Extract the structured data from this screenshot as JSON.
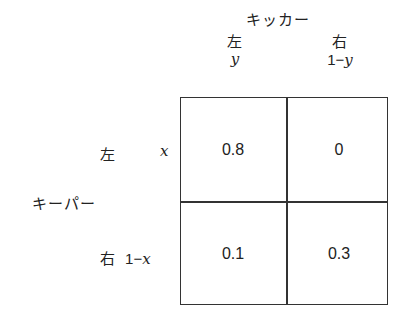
{
  "column_player": {
    "label": "キッカー",
    "strategies": [
      {
        "name": "左",
        "prob": "y"
      },
      {
        "name": "右",
        "prob_num": "1",
        "prob_op": "−",
        "prob_var": "y"
      }
    ]
  },
  "row_player": {
    "label": "キーパー",
    "strategies": [
      {
        "name": "左",
        "prob": "x"
      },
      {
        "name": "右",
        "prob_num": "1",
        "prob_op": "−",
        "prob_var": "x"
      }
    ]
  },
  "payoff_matrix": {
    "rows": [
      [
        "0.8",
        "0"
      ],
      [
        "0.1",
        "0.3"
      ]
    ]
  }
}
